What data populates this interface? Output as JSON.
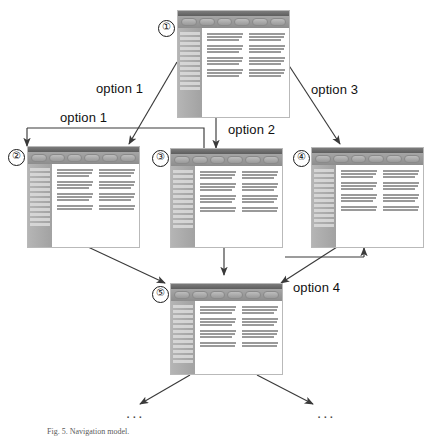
{
  "figure": {
    "type": "state-transition-diagram",
    "caption": "Fig. 5. Navigation model."
  },
  "nodes": [
    {
      "id": "node-1",
      "marker": "①",
      "label": "1",
      "toolbar_buttons": 6,
      "sidebar_lines": 12,
      "text_columns": 2
    },
    {
      "id": "node-2",
      "marker": "②",
      "label": "2",
      "toolbar_buttons": 6,
      "sidebar_lines": 12,
      "text_columns": 2
    },
    {
      "id": "node-3",
      "marker": "③",
      "label": "3",
      "toolbar_buttons": 6,
      "sidebar_lines": 12,
      "text_columns": 2
    },
    {
      "id": "node-4",
      "marker": "④",
      "label": "4",
      "toolbar_buttons": 6,
      "sidebar_lines": 12,
      "text_columns": 2
    },
    {
      "id": "node-5",
      "marker": "⑤",
      "label": "5",
      "toolbar_buttons": 6,
      "sidebar_lines": 12,
      "text_columns": 2
    }
  ],
  "edge_labels": {
    "option1_diagonal": "option 1",
    "option1_elbow": "option 1",
    "option2": "option 2",
    "option3": "option 3",
    "option4": "option 4"
  },
  "ellipsis": {
    "left": "...",
    "right": "..."
  },
  "colors": {
    "titlebar": "#5e5e5e",
    "toolbar": "#8d8d8d",
    "sidebar": "#a2a2a2",
    "page": "#ffffff",
    "text_line": "#9a9a9a",
    "arrow": "#3a3a3a",
    "label_text": "#111111"
  }
}
